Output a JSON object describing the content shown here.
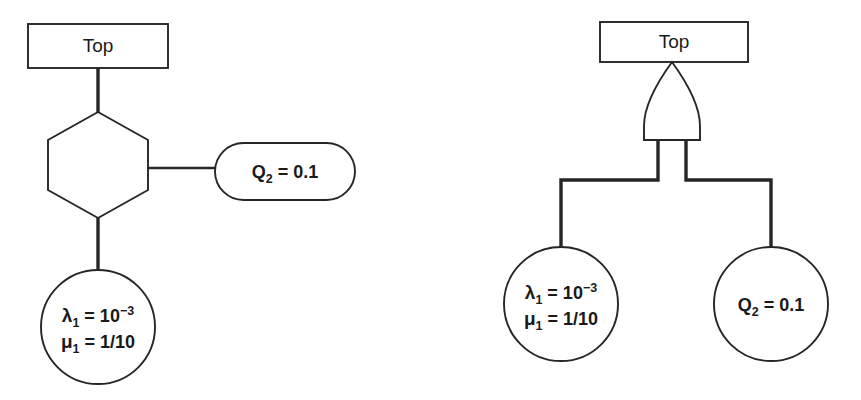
{
  "figure": {
    "background_color": "#ffffff",
    "stroke_color": "#262626",
    "fill_color": "#ffffff"
  },
  "diagrams": [
    {
      "id": "left-diagram",
      "name": "hexagon-gate-tree",
      "nodes": {
        "top_box": {
          "shape": "rectangle",
          "label": "Top"
        },
        "gate": {
          "shape": "hexagon",
          "label": ""
        },
        "event_lambda": {
          "shape": "circle",
          "line1_symbol": "λ",
          "line1_subscript": "1",
          "line1_equals": " = 10",
          "line1_superscript": "−3",
          "line2_symbol": "μ",
          "line2_subscript": "1",
          "line2_equals": " = 1/10",
          "full_text": "λ₁ = 10⁻³  μ₁ = 1/10"
        },
        "event_q2": {
          "shape": "stadium",
          "symbol": "Q",
          "subscript": "2",
          "equals": " = 0.1",
          "full_text": "Q₂ = 0.1"
        }
      }
    },
    {
      "id": "right-diagram",
      "name": "and-gate-tree",
      "nodes": {
        "top_box": {
          "shape": "rectangle",
          "label": "Top"
        },
        "gate": {
          "shape": "and-gate",
          "label": ""
        },
        "event_lambda": {
          "shape": "circle",
          "line1_symbol": "λ",
          "line1_subscript": "1",
          "line1_equals": " = 10",
          "line1_superscript": "−3",
          "line2_symbol": "μ",
          "line2_subscript": "1",
          "line2_equals": " = 1/10",
          "full_text": "λ₁ = 10⁻³  μ₁ = 1/10"
        },
        "event_q2": {
          "shape": "circle",
          "symbol": "Q",
          "subscript": "2",
          "equals": " = 0.1",
          "full_text": "Q₂ = 0.1"
        }
      }
    }
  ]
}
